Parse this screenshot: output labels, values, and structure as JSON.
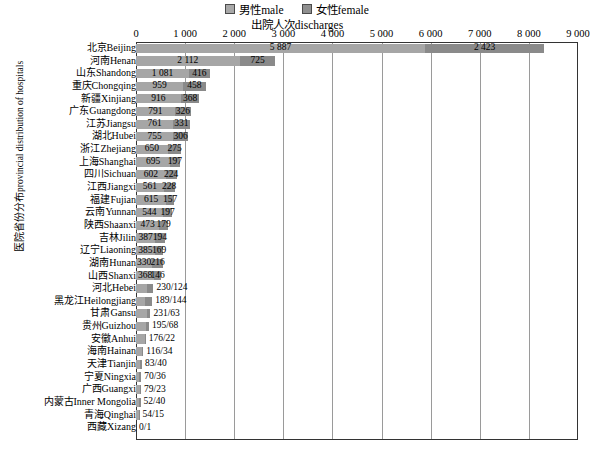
{
  "legend": {
    "items": [
      {
        "label": "男性male",
        "icon": "legend-swatch-male",
        "color": "#a6a6a6"
      },
      {
        "label": "女性female",
        "icon": "legend-swatch-female",
        "color": "#8a8a8a"
      }
    ]
  },
  "axis_title": "出院人次discharges",
  "ylabel_cn": "医院省份分布",
  "ylabel_en": "provincial distribution of hospitals",
  "chart_data": {
    "type": "bar",
    "orientation": "horizontal",
    "stacked": true,
    "title": "出院人次discharges",
    "xlabel": "出院人次discharges",
    "ylabel": "医院省份分布 provincial distribution of hospitals",
    "xlim": [
      0,
      9000
    ],
    "xticks": [
      0,
      1000,
      2000,
      3000,
      4000,
      5000,
      6000,
      7000,
      8000,
      9000
    ],
    "xticklabels": [
      "0",
      "1 000",
      "2 000",
      "3 000",
      "4 000",
      "5 000",
      "6 000",
      "7 000",
      "8 000",
      "9 000"
    ],
    "grid": true,
    "legend_position": "top-center",
    "categories": [
      "北京Beijing",
      "河南Henan",
      "山东Shandong",
      "重庆Chongqing",
      "新疆Xinjiang",
      "广东Guangdong",
      "江苏Jiangsu",
      "湖北Hubei",
      "浙江Zhejiang",
      "上海Shanghai",
      "四川Sichuan",
      "江西Jiangxi",
      "福建Fujian",
      "云南Yunnan",
      "陕西Shaanxi",
      "吉林Jilin",
      "辽宁Liaoning",
      "湖南Hunan",
      "山西Shanxi",
      "河北Hebei",
      "黑龙江Heilongjiang",
      "甘肃Gansu",
      "贵州Guizhou",
      "安徽Anhui",
      "海南Hainan",
      "天津Tianjin",
      "宁夏Ningxia",
      "广西Guangxi",
      "内蒙古Inner Mongolia",
      "青海Qinghai",
      "西藏Xizang"
    ],
    "series": [
      {
        "name": "男性male",
        "values": [
          5887,
          2112,
          1081,
          959,
          916,
          791,
          761,
          755,
          650,
          695,
          602,
          561,
          615,
          544,
          473,
          387,
          385,
          330,
          368,
          230,
          189,
          231,
          195,
          176,
          116,
          83,
          70,
          79,
          52,
          54,
          0
        ]
      },
      {
        "name": "女性female",
        "values": [
          2423,
          725,
          416,
          458,
          368,
          326,
          331,
          306,
          275,
          197,
          224,
          228,
          157,
          197,
          179,
          194,
          169,
          216,
          146,
          124,
          144,
          63,
          68,
          22,
          34,
          40,
          36,
          23,
          40,
          15,
          1
        ]
      }
    ],
    "rows": [
      {
        "label": "北京Beijing",
        "male": 5887,
        "female": 2423,
        "male_text": "5 887",
        "female_text": "2 423",
        "combined_text": null
      },
      {
        "label": "河南Henan",
        "male": 2112,
        "female": 725,
        "male_text": "2 112",
        "female_text": "725",
        "combined_text": null
      },
      {
        "label": "山东Shandong",
        "male": 1081,
        "female": 416,
        "male_text": "1 081",
        "female_text": "416",
        "combined_text": null
      },
      {
        "label": "重庆Chongqing",
        "male": 959,
        "female": 458,
        "male_text": "959",
        "female_text": "458",
        "combined_text": null
      },
      {
        "label": "新疆Xinjiang",
        "male": 916,
        "female": 368,
        "male_text": "916",
        "female_text": "368",
        "combined_text": null
      },
      {
        "label": "广东Guangdong",
        "male": 791,
        "female": 326,
        "male_text": "791",
        "female_text": "326",
        "combined_text": null
      },
      {
        "label": "江苏Jiangsu",
        "male": 761,
        "female": 331,
        "male_text": "761",
        "female_text": "331",
        "combined_text": null
      },
      {
        "label": "湖北Hubei",
        "male": 755,
        "female": 306,
        "male_text": "755",
        "female_text": "306",
        "combined_text": null
      },
      {
        "label": "浙江Zhejiang",
        "male": 650,
        "female": 275,
        "male_text": "650",
        "female_text": "275",
        "combined_text": null
      },
      {
        "label": "上海Shanghai",
        "male": 695,
        "female": 197,
        "male_text": "695",
        "female_text": "197",
        "combined_text": null
      },
      {
        "label": "四川Sichuan",
        "male": 602,
        "female": 224,
        "male_text": "602",
        "female_text": "224",
        "combined_text": null
      },
      {
        "label": "江西Jiangxi",
        "male": 561,
        "female": 228,
        "male_text": "561",
        "female_text": "228",
        "combined_text": null
      },
      {
        "label": "福建Fujian",
        "male": 615,
        "female": 157,
        "male_text": "615",
        "female_text": "157",
        "combined_text": null
      },
      {
        "label": "云南Yunnan",
        "male": 544,
        "female": 197,
        "male_text": "544",
        "female_text": "197",
        "combined_text": null
      },
      {
        "label": "陕西Shaanxi",
        "male": 473,
        "female": 179,
        "male_text": "473",
        "female_text": "179",
        "combined_text": null
      },
      {
        "label": "吉林Jilin",
        "male": 387,
        "female": 194,
        "male_text": "387",
        "female_text": "194",
        "combined_text": null
      },
      {
        "label": "辽宁Liaoning",
        "male": 385,
        "female": 169,
        "male_text": "385",
        "female_text": "169",
        "combined_text": null
      },
      {
        "label": "湖南Hunan",
        "male": 330,
        "female": 216,
        "male_text": "330",
        "female_text": "216",
        "combined_text": null
      },
      {
        "label": "山西Shanxi",
        "male": 368,
        "female": 146,
        "male_text": "368",
        "female_text": "146",
        "combined_text": null
      },
      {
        "label": "河北Hebei",
        "male": 230,
        "female": 124,
        "male_text": null,
        "female_text": null,
        "combined_text": "230/124"
      },
      {
        "label": "黑龙江Heilongjiang",
        "male": 189,
        "female": 144,
        "male_text": null,
        "female_text": null,
        "combined_text": "189/144"
      },
      {
        "label": "甘肃Gansu",
        "male": 231,
        "female": 63,
        "male_text": null,
        "female_text": null,
        "combined_text": "231/63"
      },
      {
        "label": "贵州Guizhou",
        "male": 195,
        "female": 68,
        "male_text": null,
        "female_text": null,
        "combined_text": "195/68"
      },
      {
        "label": "安徽Anhui",
        "male": 176,
        "female": 22,
        "male_text": null,
        "female_text": null,
        "combined_text": "176/22"
      },
      {
        "label": "海南Hainan",
        "male": 116,
        "female": 34,
        "male_text": null,
        "female_text": null,
        "combined_text": "116/34"
      },
      {
        "label": "天津Tianjin",
        "male": 83,
        "female": 40,
        "male_text": null,
        "female_text": null,
        "combined_text": "83/40"
      },
      {
        "label": "宁夏Ningxia",
        "male": 70,
        "female": 36,
        "male_text": null,
        "female_text": null,
        "combined_text": "70/36"
      },
      {
        "label": "广西Guangxi",
        "male": 79,
        "female": 23,
        "male_text": null,
        "female_text": null,
        "combined_text": "79/23"
      },
      {
        "label": "内蒙古Inner Mongolia",
        "male": 52,
        "female": 40,
        "male_text": null,
        "female_text": null,
        "combined_text": "52/40"
      },
      {
        "label": "青海Qinghai",
        "male": 54,
        "female": 15,
        "male_text": null,
        "female_text": null,
        "combined_text": "54/15"
      },
      {
        "label": "西藏Xizang",
        "male": 0,
        "female": 1,
        "male_text": null,
        "female_text": null,
        "combined_text": "0/1"
      }
    ]
  }
}
